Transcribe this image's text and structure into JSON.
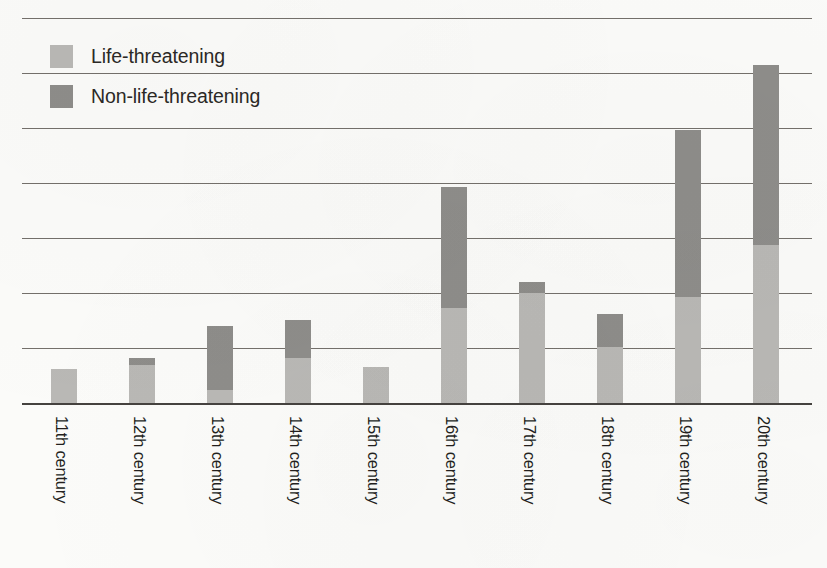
{
  "chart_data": {
    "type": "bar",
    "subtype": "stacked-vertical",
    "title": "",
    "xlabel": "",
    "ylabel": "",
    "grid": true,
    "gridlines": 7,
    "ylim": [
      0,
      7
    ],
    "legend_position": "top-left",
    "categories": [
      "11th century",
      "12th century",
      "13th century",
      "14th century",
      "15th century",
      "16th century",
      "17th century",
      "18th century",
      "19th century",
      "20th century"
    ],
    "series": [
      {
        "name": "Life-threatening",
        "color": "#b9b8b5",
        "values": [
          0.62,
          0.69,
          0.24,
          0.82,
          0.65,
          1.73,
          2.0,
          1.02,
          1.93,
          2.87
        ]
      },
      {
        "name": "Non-life-threatening",
        "color": "#8e8d8a",
        "values": [
          0.0,
          0.13,
          1.16,
          0.69,
          0.0,
          2.2,
          0.2,
          0.6,
          3.04,
          3.27
        ]
      }
    ],
    "totals": [
      0.62,
      0.82,
      1.4,
      1.51,
      0.65,
      3.93,
      2.2,
      1.62,
      4.97,
      6.14
    ]
  },
  "legend": {
    "items": [
      {
        "label": "Life-threatening",
        "swatch": "light"
      },
      {
        "label": "Non-life-threatening",
        "swatch": "dark"
      }
    ]
  },
  "colors": {
    "light_gray": "#b9b8b5",
    "dark_gray": "#8e8d8a",
    "gridline": "#55504c",
    "axis": "#3b3835",
    "text": "#231f1d",
    "background": "#fbfbf9"
  }
}
